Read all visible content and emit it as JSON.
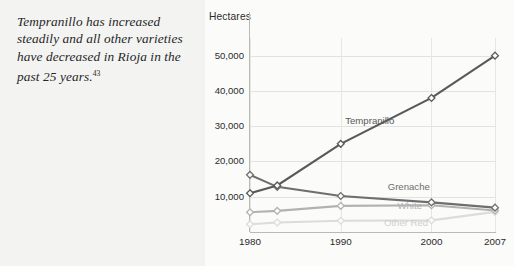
{
  "caption": {
    "text": "Tempranillo has increased steadily and all other varieties have decreased in Rioja in the past 25 years.",
    "footnote": "43"
  },
  "chart_data": {
    "type": "line",
    "title": "",
    "ylabel": "Hectares",
    "xlabel": "",
    "x": [
      1980,
      1983,
      1990,
      2000,
      2007
    ],
    "xtick_labels": [
      "1980",
      "1990",
      "2000",
      "2007"
    ],
    "xtick_values": [
      1980,
      1990,
      2000,
      2007
    ],
    "ytick_labels": [
      "10,000",
      "20,000",
      "30,000",
      "40,000",
      "50,000"
    ],
    "ytick_values": [
      10000,
      20000,
      30000,
      40000,
      50000
    ],
    "ylim": [
      0,
      55000
    ],
    "xlim": [
      1980,
      2007
    ],
    "grid": true,
    "legend_position": "inline-right",
    "series": [
      {
        "name": "Tempranillo",
        "color": "#595959",
        "values": [
          11000,
          13200,
          25000,
          38000,
          50000
        ],
        "label_x": 1993.2,
        "label_y": 31500
      },
      {
        "name": "Grenache",
        "color": "#6e6e6e",
        "values": [
          16200,
          12800,
          10200,
          8400,
          6900
        ],
        "label_x": 1997.5,
        "label_y": 12700
      },
      {
        "name": "White",
        "color": "#b2b2b2",
        "values": [
          5600,
          6000,
          7400,
          7600,
          6100
        ],
        "label_x": 1997.6,
        "label_y": 7400
      },
      {
        "name": "Other Red",
        "color": "#dcdcda",
        "values": [
          2200,
          2700,
          3200,
          3300,
          5700
        ],
        "label_x": 1997.2,
        "label_y": 2500
      }
    ]
  }
}
